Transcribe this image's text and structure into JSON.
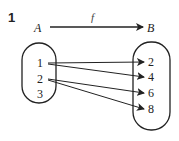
{
  "problem_number": "1",
  "mapping": {
    "function_label": "f",
    "domain_label": "A",
    "codomain_label": "B",
    "domain": [
      "1",
      "2",
      "3"
    ],
    "codomain": [
      "2",
      "4",
      "6",
      "8"
    ],
    "arrows": [
      {
        "from": "1",
        "to": "2"
      },
      {
        "from": "1",
        "to": "4"
      },
      {
        "from": "2",
        "to": "6"
      },
      {
        "from": "2",
        "to": "8"
      }
    ]
  },
  "colors": {
    "ink": "#222222",
    "background": "#ffffff"
  }
}
